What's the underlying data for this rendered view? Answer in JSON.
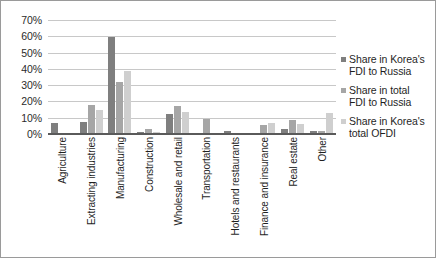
{
  "chart_data": {
    "type": "bar",
    "title": "",
    "subtitle": "",
    "xlabel": "",
    "ylabel": "",
    "ylim": [
      0,
      70
    ],
    "ytick_labels": [
      "70%",
      "60%",
      "50%",
      "40%",
      "30%",
      "20%",
      "10%",
      "0%"
    ],
    "ytick_values": [
      70,
      60,
      50,
      40,
      30,
      20,
      10,
      0
    ],
    "grid": true,
    "legend_position": "right",
    "categories": [
      "Agriculture",
      "Extracting industries",
      "Manufacturing",
      "Construction",
      "Wholesale and retail",
      "Transportation",
      "Hotels and restaurants",
      "Finance and insurance",
      "Real estate",
      "Other"
    ],
    "series": [
      {
        "name": "Share in Korea's FDI to Russia",
        "color": "#7f7f7f",
        "values": [
          6.8,
          7.5,
          59.5,
          1.5,
          12.5,
          0.8,
          1.8,
          0.5,
          3.0,
          1.8
        ]
      },
      {
        "name": "Share in total FDI to Russia",
        "color": "#a6a6a6",
        "values": [
          0.2,
          18.0,
          32.0,
          3.2,
          17.0,
          9.0,
          0.1,
          5.7,
          8.3,
          1.7
        ]
      },
      {
        "name": "Share in Korea's total OFDI",
        "color": "#cfcfcf",
        "values": [
          0.1,
          14.5,
          39.0,
          1.2,
          13.8,
          0.7,
          0.1,
          6.5,
          6.3,
          13.0
        ]
      }
    ]
  },
  "legend": {
    "items": [
      {
        "label_line1": "Share in Korea's",
        "label_line2": "FDI to Russia"
      },
      {
        "label_line1": "Share in total",
        "label_line2": "FDI to Russia"
      },
      {
        "label_line1": "Share in Korea's",
        "label_line2": "total OFDI"
      }
    ]
  }
}
